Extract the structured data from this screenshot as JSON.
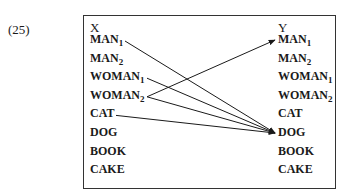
{
  "example_number": "(25)",
  "left_column": {
    "header": "X",
    "items": [
      {
        "base": "MAN",
        "sub": "1"
      },
      {
        "base": "MAN",
        "sub": "2"
      },
      {
        "base": "WOMAN",
        "sub": "1"
      },
      {
        "base": "WOMAN",
        "sub": "2"
      },
      {
        "base": "CAT",
        "sub": ""
      },
      {
        "base": "DOG",
        "sub": ""
      },
      {
        "base": "BOOK",
        "sub": ""
      },
      {
        "base": "CAKE",
        "sub": ""
      }
    ]
  },
  "right_column": {
    "header": "Y",
    "items": [
      {
        "base": "MAN",
        "sub": "1"
      },
      {
        "base": "MAN",
        "sub": "2"
      },
      {
        "base": "WOMAN",
        "sub": "1"
      },
      {
        "base": "WOMAN",
        "sub": "2"
      },
      {
        "base": "CAT",
        "sub": ""
      },
      {
        "base": "DOG",
        "sub": ""
      },
      {
        "base": "BOOK",
        "sub": ""
      },
      {
        "base": "CAKE",
        "sub": ""
      }
    ]
  },
  "mappings": [
    {
      "from": "MAN1",
      "to": "DOG"
    },
    {
      "from": "WOMAN1",
      "to": "DOG"
    },
    {
      "from": "WOMAN2",
      "to": "MAN1"
    },
    {
      "from": "WOMAN2",
      "to": "DOG"
    },
    {
      "from": "CAT",
      "to": "DOG"
    }
  ]
}
